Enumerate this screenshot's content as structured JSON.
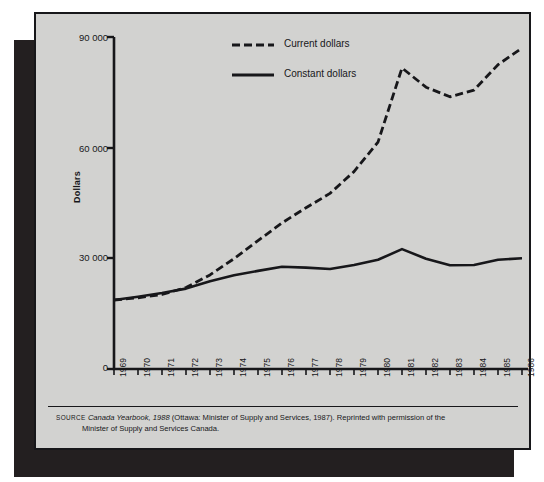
{
  "figure": {
    "ylabel": "Dollars",
    "y_ticks": [
      "0",
      "30 000",
      "60 000",
      "90 000"
    ],
    "x_ticks": [
      "1969",
      "1970",
      "1971",
      "1972",
      "1973",
      "1974",
      "1975",
      "1976",
      "1977",
      "1978",
      "1979",
      "1980",
      "1981",
      "1982",
      "1983",
      "1984",
      "1985",
      "1986"
    ],
    "legend": [
      {
        "label": "Current dollars",
        "style": "dashed"
      },
      {
        "label": "Constant dollars",
        "style": "solid"
      }
    ],
    "source": {
      "prefix": "SOURCE",
      "title": "Canada Yearbook, 1988",
      "rest": " (Ottawa: Minister of Supply and Services, 1987). Reprinted with permission of the",
      "line2": "Minister of Supply and Services Canada."
    },
    "colors": {
      "panel": "#d2d2d0",
      "ink": "#17171a",
      "shadow": "#231f20",
      "page": "#ffffff"
    }
  },
  "chart_data": {
    "type": "line",
    "title": "",
    "xlabel": "",
    "ylabel": "Dollars",
    "xlim": [
      1969,
      1986
    ],
    "ylim": [
      0,
      90000
    ],
    "y_ticks": [
      0,
      30000,
      60000,
      90000
    ],
    "grid": false,
    "legend_position": "top-center",
    "x": [
      1969,
      1970,
      1971,
      1972,
      1973,
      1974,
      1975,
      1976,
      1977,
      1978,
      1979,
      1980,
      1981,
      1982,
      1983,
      1984,
      1985,
      1986
    ],
    "series": [
      {
        "name": "Current dollars",
        "style": "dashed",
        "values": [
          18700,
          19300,
          20200,
          22100,
          25500,
          29900,
          34800,
          39600,
          43700,
          47600,
          53500,
          61500,
          81600,
          76400,
          73800,
          75600,
          82500,
          87000
        ]
      },
      {
        "name": "Constant dollars",
        "style": "solid",
        "values": [
          18700,
          19600,
          20600,
          21800,
          23800,
          25400,
          26600,
          27700,
          27500,
          27100,
          28200,
          29600,
          32500,
          29900,
          28100,
          28200,
          29600,
          30000
        ]
      }
    ]
  }
}
